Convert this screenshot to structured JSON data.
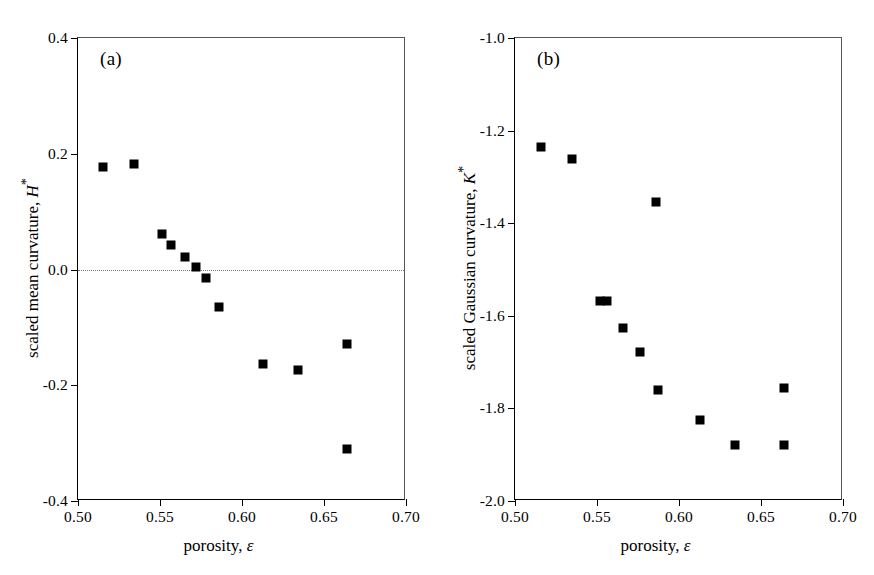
{
  "figure": {
    "width": 874,
    "height": 575,
    "background": "#ffffff",
    "marker_color": "#000000"
  },
  "chart_data": [
    {
      "type": "scatter",
      "panel_tag": "(a)",
      "title": "",
      "xlabel_plain": "porosity, ε",
      "xlabel_text": "porosity,",
      "xlabel_symbol": "ε",
      "ylabel_plain": "scaled mean curvature, H*",
      "ylabel_text": "scaled mean curvature,",
      "ylabel_symbol": "H",
      "ylabel_superscript": "*",
      "xlim": [
        0.5,
        0.7
      ],
      "ylim": [
        -0.4,
        0.4
      ],
      "xticks": [
        0.5,
        0.55,
        0.6,
        0.65,
        0.7
      ],
      "xticklabels": [
        "0.50",
        "0.55",
        "0.60",
        "0.65",
        "0.70"
      ],
      "yticks": [
        0.4,
        0.2,
        0.0,
        -0.2,
        -0.4
      ],
      "yticklabels": [
        "0.4",
        "0.2",
        "0.0",
        "-0.2",
        "-0.4"
      ],
      "grid": false,
      "legend": false,
      "reference_line_y": 0.0,
      "reference_line_style": "dotted",
      "marker": "filled-square",
      "x": [
        0.515,
        0.534,
        0.551,
        0.557,
        0.565,
        0.572,
        0.578,
        0.586,
        0.613,
        0.634,
        0.664,
        0.664
      ],
      "y": [
        0.177,
        0.182,
        0.061,
        0.043,
        0.022,
        0.005,
        -0.014,
        -0.065,
        -0.163,
        -0.174,
        -0.129,
        -0.311
      ]
    },
    {
      "type": "scatter",
      "panel_tag": "(b)",
      "title": "",
      "xlabel_plain": "porosity, ε",
      "xlabel_text": "porosity,",
      "xlabel_symbol": "ε",
      "ylabel_plain": "scaled Gaussian curvature, K*",
      "ylabel_text": "scaled Gaussian curvature,",
      "ylabel_symbol": "K",
      "ylabel_superscript": "*",
      "xlim": [
        0.5,
        0.7
      ],
      "ylim": [
        -2.0,
        -1.0
      ],
      "xticks": [
        0.5,
        0.55,
        0.6,
        0.65,
        0.7
      ],
      "xticklabels": [
        "0.50",
        "0.55",
        "0.60",
        "0.65",
        "0.70"
      ],
      "yticks": [
        -1.0,
        -1.2,
        -1.4,
        -1.6,
        -1.8,
        -2.0
      ],
      "yticklabels": [
        "-1.0",
        "-1.2",
        "-1.4",
        "-1.6",
        "-1.8",
        "-2.0"
      ],
      "grid": false,
      "legend": false,
      "reference_line_y": null,
      "marker": "filled-square",
      "x": [
        0.516,
        0.535,
        0.552,
        0.556,
        0.566,
        0.576,
        0.586,
        0.587,
        0.613,
        0.634,
        0.664,
        0.664
      ],
      "y": [
        -1.235,
        -1.262,
        -1.567,
        -1.567,
        -1.627,
        -1.679,
        -1.355,
        -1.76,
        -1.824,
        -1.879,
        -1.757,
        -1.88
      ]
    }
  ]
}
